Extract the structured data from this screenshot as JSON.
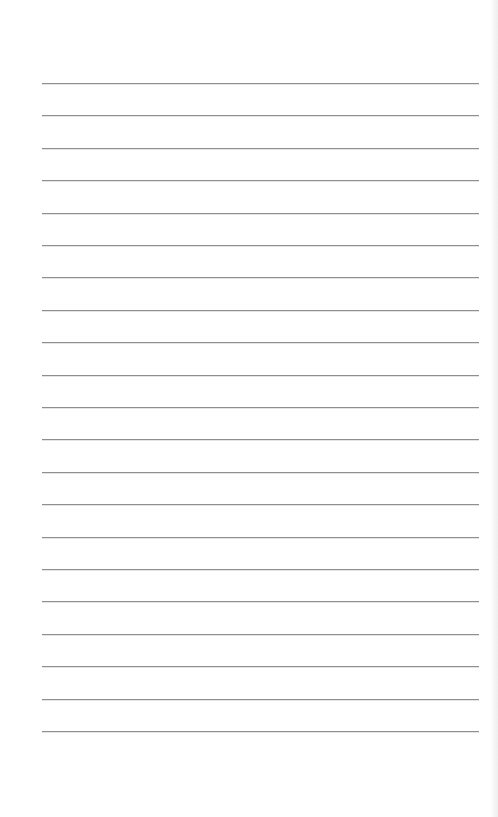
{
  "page": {
    "type": "lined-paper",
    "background_color": "#ffffff",
    "line_color": "#8f8f8f",
    "line_count": 21,
    "first_line_y": 83,
    "line_spacing": 32.4,
    "line_left_x": 42,
    "line_right_x": 479
  }
}
